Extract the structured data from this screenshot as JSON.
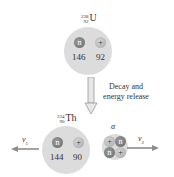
{
  "parent_nucleus": {
    "symbol": "U",
    "mass_number": "238",
    "atomic_number": "92",
    "neutron_label": "n",
    "proton_label": "+",
    "neutron_count": "146",
    "proton_count": "92"
  },
  "process": {
    "label_line1": "Decay and",
    "label_line2": "energy release"
  },
  "daughter_nucleus": {
    "symbol": "Th",
    "mass_number": "234",
    "atomic_number": "90",
    "neutron_label": "n",
    "proton_label": "+",
    "neutron_count": "144",
    "proton_count": "90",
    "velocity_symbol": "v",
    "velocity_sub": "1"
  },
  "alpha_particle": {
    "label": "α",
    "particles": [
      "+",
      "n",
      "n",
      "+"
    ],
    "velocity_symbol": "v",
    "velocity_sub": "2"
  },
  "colors": {
    "nucleus_fill": "#dcdcdc",
    "neutron": "#7a7a7a",
    "proton": "#bdbdbd",
    "arrow": "#8c8c8c"
  }
}
